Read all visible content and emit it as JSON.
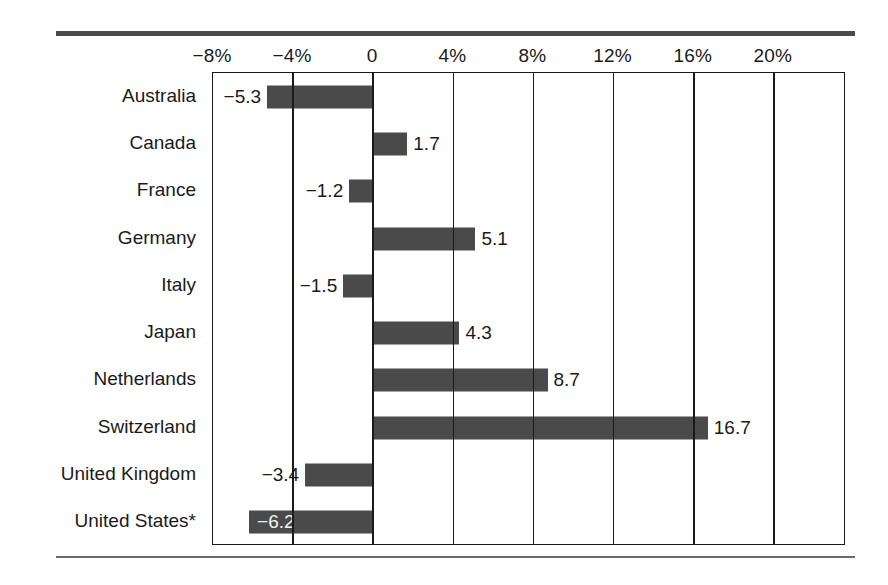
{
  "chart_data": {
    "type": "bar",
    "orientation": "horizontal",
    "title": "",
    "subtitle": "",
    "xlabel": "",
    "ylabel": "",
    "grid": true,
    "legend": false,
    "xlim": [
      -8,
      23.6
    ],
    "categories": [
      "Australia",
      "Canada",
      "France",
      "Germany",
      "Italy",
      "Japan",
      "Netherlands",
      "Switzerland",
      "United Kingdom",
      "United States*"
    ],
    "values": [
      -5.3,
      1.7,
      -1.2,
      5.1,
      -1.5,
      4.3,
      8.7,
      16.7,
      -3.4,
      -6.2
    ],
    "data_labels": [
      "−5.3",
      "1.7",
      "−1.2",
      "5.1",
      "−1.5",
      "4.3",
      "8.7",
      "16.7",
      "−3.4",
      "−6.2"
    ],
    "label_placement": [
      "outside",
      "outside",
      "outside",
      "outside",
      "outside",
      "outside",
      "outside",
      "outside",
      "outside",
      "inside"
    ],
    "xticks": [
      -8,
      -4,
      0,
      4,
      8,
      12,
      16,
      20
    ],
    "xticklabels": [
      "−8%",
      "−4%",
      "0",
      "4%",
      "8%",
      "12%",
      "16%",
      "20%"
    ],
    "bar_color": "#4a4a4a",
    "inside_label_color": "#f2f2f2",
    "axis_color": "#1a1a1a",
    "background_color": "#ffffff",
    "footnote": "*"
  }
}
